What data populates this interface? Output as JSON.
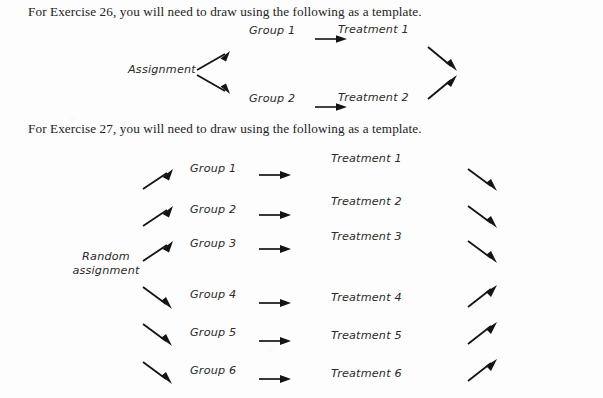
{
  "page": {
    "width": 603,
    "height": 398,
    "background_color": "#fdfdfd",
    "ink_color": "#141414"
  },
  "exercise26": {
    "instruction": "For Exercise 26, you will need to draw using the following as a template.",
    "source_label": "Assignment",
    "rows": [
      {
        "group": "Group 1",
        "treatment": "Treatment 1"
      },
      {
        "group": "Group 2",
        "treatment": "Treatment 2"
      }
    ],
    "arrows": {
      "branch_up": "arrow-up-right-icon",
      "branch_down": "arrow-down-right-icon",
      "group_to_treatment": "arrow-right-icon",
      "converge_down": "arrow-down-right-icon",
      "converge_up": "arrow-up-right-icon"
    }
  },
  "exercise27": {
    "instruction": "For Exercise 27, you will need to draw using the following as a template.",
    "source_label_line1": "Random",
    "source_label_line2": "assignment",
    "rows": [
      {
        "group": "Group 1",
        "treatment": "Treatment 1",
        "in_arrow": "arrow-up-right-icon",
        "out_arrow": "arrow-down-right-icon"
      },
      {
        "group": "Group 2",
        "treatment": "Treatment 2",
        "in_arrow": "arrow-up-right-icon",
        "out_arrow": "arrow-down-right-icon"
      },
      {
        "group": "Group 3",
        "treatment": "Treatment 3",
        "in_arrow": "arrow-up-right-icon",
        "out_arrow": "arrow-down-right-icon"
      },
      {
        "group": "Group 4",
        "treatment": "Treatment 4",
        "in_arrow": "arrow-down-right-icon",
        "out_arrow": "arrow-up-right-icon"
      },
      {
        "group": "Group 5",
        "treatment": "Treatment 5",
        "in_arrow": "arrow-down-right-icon",
        "out_arrow": "arrow-up-right-icon"
      },
      {
        "group": "Group 6",
        "treatment": "Treatment 6",
        "in_arrow": "arrow-down-right-icon",
        "out_arrow": "arrow-up-right-icon"
      }
    ],
    "arrows": {
      "group_to_treatment": "arrow-right-icon"
    }
  }
}
